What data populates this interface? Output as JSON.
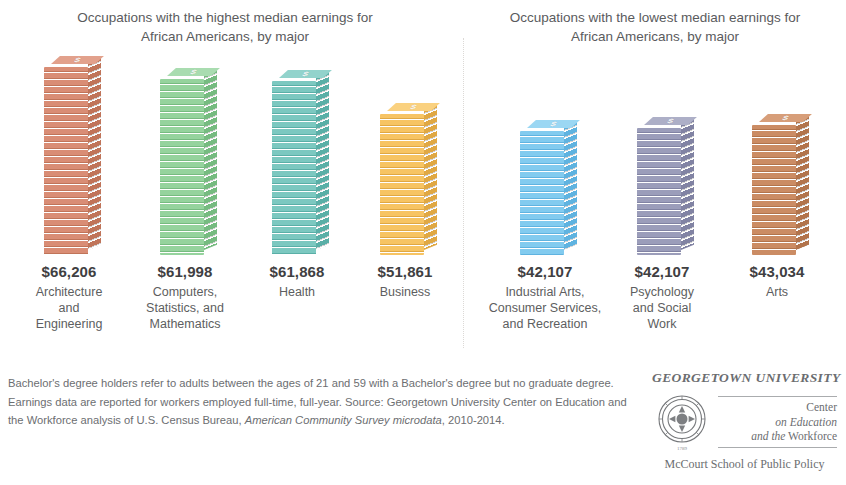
{
  "panels": {
    "left_title": "Occupations with the highest median earnings for African Americans, by major",
    "right_title": "Occupations with the lowest median earnings for African Americans, by major"
  },
  "footnote": {
    "line1": "Bachelor's degree holders refer to adults between the ages of 21 and 59 with a Bachelor's degree",
    "line2": "but no graduate degree. Earnings data are reported for workers employed full-time, full-year. Source:",
    "line3": "Georgetown University Center on Education and the Workforce analysis of U.S. Census Bureau,",
    "line3_italic": "American",
    "line4_italic": "Community Survey microdata",
    "line4": ", 2010-2014."
  },
  "logo": {
    "wordmark": "GEORGETOWN UNIVERSITY",
    "center_line1": "Center",
    "center_line2": "on Education",
    "center_line3_italic": "and the",
    "center_line3": "Workforce",
    "school": "McCourt School of Public Policy",
    "seal_name": "georgetown-seal-icon"
  },
  "chart_data": {
    "type": "bar",
    "xlabel": "",
    "ylabel": "Median earnings (USD)",
    "grid": false,
    "legend": "none",
    "value_prefix": "$",
    "panels": [
      {
        "name": "highest",
        "title": "Occupations with the highest median earnings for African Americans, by major",
        "categories": [
          "Architecture and Engineering",
          "Computers, Statistics, and Mathematics",
          "Health",
          "Business"
        ],
        "values": [
          66206,
          61998,
          61868,
          51861
        ],
        "value_labels": [
          "$66,206",
          "$61,998",
          "$61,868",
          "$51,861"
        ],
        "colors": [
          "#d98d75",
          "#8fd39a",
          "#76c5bd",
          "#f5c060"
        ]
      },
      {
        "name": "lowest",
        "title": "Occupations with the lowest median earnings for African Americans, by major",
        "categories": [
          "Industrial Arts, Consumer Services, and Recreation",
          "Psychology and Social Work",
          "Arts"
        ],
        "values": [
          42107,
          42107,
          43034
        ],
        "value_labels": [
          "$42,107",
          "$42,107",
          "$43,034"
        ],
        "colors": [
          "#7ec8ec",
          "#9a9cb8",
          "#c98b63"
        ]
      }
    ]
  },
  "bars": [
    {
      "label": "$66,206",
      "category_lines": [
        "Architecture",
        "and",
        "Engineering"
      ],
      "value": 66206,
      "color": "#d98d75",
      "color_dark": "#c07459",
      "color_top": "#e2a18c",
      "left": 44,
      "height": 188,
      "name": "bar-architecture-and-engineering"
    },
    {
      "label": "$61,998",
      "category_lines": [
        "Computers,",
        "Statistics, and",
        "Mathematics"
      ],
      "value": 61998,
      "color": "#95d39d",
      "color_dark": "#76bb80",
      "color_top": "#a9dcb0",
      "left": 160,
      "height": 176,
      "name": "bar-computers-statistics-mathematics"
    },
    {
      "label": "$61,868",
      "category_lines": [
        "Health"
      ],
      "value": 61868,
      "color": "#7cc8c0",
      "color_dark": "#5aafa7",
      "color_top": "#92d3cc",
      "left": 272,
      "height": 174,
      "name": "bar-health"
    },
    {
      "label": "$51,861",
      "category_lines": [
        "Business"
      ],
      "value": 51861,
      "color": "#f7c463",
      "color_dark": "#e0a843",
      "color_top": "#fad17f",
      "left": 380,
      "height": 141,
      "name": "bar-business"
    },
    {
      "label": "$42,107",
      "category_lines": [
        "Industrial Arts,",
        "Consumer Services,",
        "and Recreation"
      ],
      "value": 42107,
      "color": "#82cbef",
      "color_dark": "#5fb3e0",
      "color_top": "#9bd7f3",
      "left": 520,
      "height": 124,
      "name": "bar-industrial-arts-consumer-services-recreation"
    },
    {
      "label": "$42,107",
      "category_lines": [
        "Psychology",
        "and Social",
        "Work"
      ],
      "value": 42107,
      "color": "#9b9dba",
      "color_dark": "#8183a3",
      "color_top": "#adafc7",
      "left": 637,
      "height": 127,
      "name": "bar-psychology-and-social-work"
    },
    {
      "label": "$43,034",
      "category_lines": [
        "Arts"
      ],
      "value": 43034,
      "color": "#cb8c64",
      "color_dark": "#b2744c",
      "color_top": "#d79e79",
      "left": 752,
      "height": 130,
      "name": "bar-arts"
    }
  ]
}
